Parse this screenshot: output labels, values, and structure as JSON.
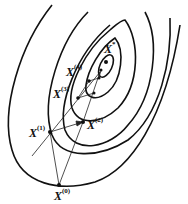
{
  "diagram": {
    "title": "",
    "type": "contour-optimization-path",
    "colors": {
      "contour": "#111111",
      "path": "#222222",
      "background": "#ffffff"
    },
    "points": [
      {
        "id": "x0",
        "base": "X",
        "sup": "(0)"
      },
      {
        "id": "x1",
        "base": "X",
        "sup": "(1)"
      },
      {
        "id": "x2",
        "base": "X",
        "sup": "(2)"
      },
      {
        "id": "x3",
        "base": "X",
        "sup": "(3)"
      },
      {
        "id": "x4",
        "base": "X",
        "sup": "(4)"
      },
      {
        "id": "xstar",
        "base": "X",
        "sup": "*"
      }
    ],
    "contour_count": 6
  }
}
